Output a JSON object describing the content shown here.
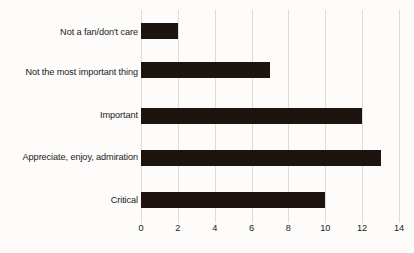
{
  "chart_data": {
    "type": "bar",
    "orientation": "horizontal",
    "title": "",
    "subtitle": "",
    "xlabel": "",
    "ylabel": "",
    "categories": [
      "Not a fan/don't care",
      "Not the most important thing",
      "Important",
      "Appreciate, enjoy, admiration",
      "Critical"
    ],
    "values": [
      2,
      7,
      12,
      13,
      10
    ],
    "xlim": [
      0,
      14
    ],
    "xticks": [
      0,
      2,
      4,
      6,
      8,
      10,
      12,
      14
    ],
    "xtick_labels": [
      "0",
      "2",
      "4",
      "6",
      "8",
      "10",
      "12",
      "14"
    ],
    "grid": "vertical",
    "legend": "none",
    "series": [
      {
        "name": "",
        "values": [
          2,
          7,
          12,
          13,
          10
        ]
      }
    ],
    "colors": {
      "bar": "#1d1410",
      "gridline": "#dedbd6",
      "background": "#fdfcfa",
      "text": "#1a1a1a"
    }
  }
}
